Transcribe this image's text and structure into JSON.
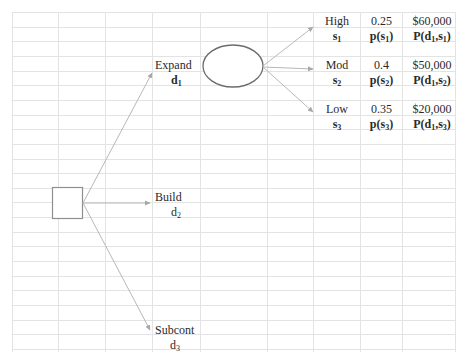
{
  "decisions": [
    {
      "label": "Expand",
      "symbol": "d",
      "subscript": "1"
    },
    {
      "label": "Build",
      "symbol": "d",
      "subscript": "2"
    },
    {
      "label": "Subcont",
      "symbol": "d",
      "subscript": "3"
    }
  ],
  "states": [
    {
      "label": "High",
      "symbol": "s",
      "subscript": "1",
      "probability": "0.25",
      "prob_symbol": "p(s",
      "prob_sub": "1",
      "payoff": "$60,000",
      "payoff_symbol": "P(d",
      "payoff_d_sub": "1",
      "payoff_s_sub": "1"
    },
    {
      "label": "Mod",
      "symbol": "s",
      "subscript": "2",
      "probability": "0.4",
      "prob_symbol": "p(s",
      "prob_sub": "2",
      "payoff": "$50,000",
      "payoff_symbol": "P(d",
      "payoff_d_sub": "1",
      "payoff_s_sub": "2"
    },
    {
      "label": "Low",
      "symbol": "s",
      "subscript": "3",
      "probability": "0.35",
      "prob_symbol": "p(s",
      "prob_sub": "3",
      "payoff": "$20,000",
      "payoff_symbol": "P(d",
      "payoff_d_sub": "1",
      "payoff_s_sub": "3"
    }
  ],
  "text": {
    "comma_s": ",s",
    "close_paren": ")"
  },
  "colors": {
    "grid": "#e2e2e2",
    "arrow": "#b4b4b4",
    "node_stroke": "#8a8a8a",
    "ellipse_stroke": "#6a6a6a"
  }
}
